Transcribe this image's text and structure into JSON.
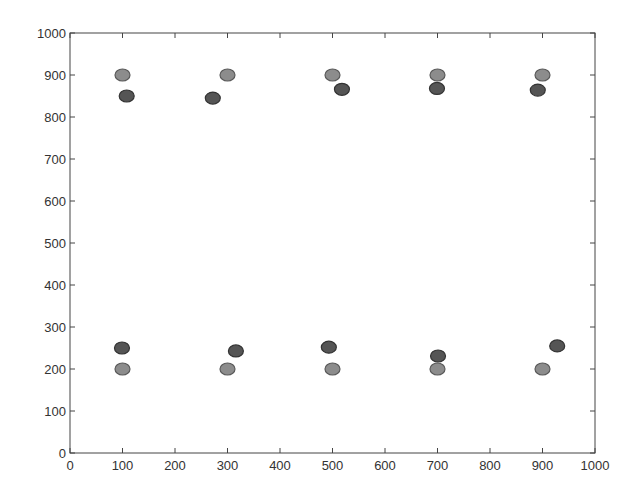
{
  "chart_data": {
    "type": "scatter",
    "title": "",
    "xlabel": "",
    "ylabel": "",
    "xlim": [
      0,
      1000
    ],
    "ylim": [
      0,
      1000
    ],
    "grid": false,
    "legend": null,
    "x_ticks": [
      0,
      100,
      200,
      300,
      400,
      500,
      600,
      700,
      800,
      900,
      1000
    ],
    "y_ticks": [
      0,
      100,
      200,
      300,
      400,
      500,
      600,
      700,
      800,
      900,
      1000
    ],
    "x_tick_labels": [
      "0",
      "100",
      "200",
      "300",
      "400",
      "500",
      "600",
      "700",
      "800",
      "900",
      "1000"
    ],
    "y_tick_labels": [
      "0",
      "100",
      "200",
      "300",
      "400",
      "500",
      "600",
      "700",
      "800",
      "900",
      "1000"
    ],
    "series": [
      {
        "name": "light",
        "color": "#8c8c8c",
        "edge_color": "#5a5a5a",
        "points": [
          {
            "x": 100,
            "y": 900
          },
          {
            "x": 300,
            "y": 900
          },
          {
            "x": 500,
            "y": 900
          },
          {
            "x": 700,
            "y": 900
          },
          {
            "x": 900,
            "y": 900
          },
          {
            "x": 100,
            "y": 200
          },
          {
            "x": 300,
            "y": 200
          },
          {
            "x": 500,
            "y": 200
          },
          {
            "x": 700,
            "y": 200
          },
          {
            "x": 900,
            "y": 200
          }
        ]
      },
      {
        "name": "dark",
        "color": "#555555",
        "edge_color": "#333333",
        "points": [
          {
            "x": 108,
            "y": 850
          },
          {
            "x": 272,
            "y": 845
          },
          {
            "x": 518,
            "y": 866
          },
          {
            "x": 699,
            "y": 868
          },
          {
            "x": 891,
            "y": 864
          },
          {
            "x": 99,
            "y": 250
          },
          {
            "x": 316,
            "y": 243
          },
          {
            "x": 493,
            "y": 252
          },
          {
            "x": 701,
            "y": 231
          },
          {
            "x": 928,
            "y": 255
          }
        ]
      }
    ]
  },
  "layout": {
    "plot_left": 70,
    "plot_right": 595,
    "plot_top": 33,
    "plot_bottom": 453,
    "marker_rx": 7.5,
    "marker_ry": 6
  }
}
